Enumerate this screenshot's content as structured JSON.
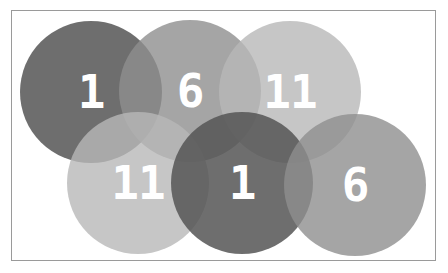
{
  "canvas": {
    "width": 448,
    "height": 273,
    "border_color": "#9a9a9a"
  },
  "circles": [
    {
      "label": "1",
      "cx": 91,
      "cy": 92,
      "r": 71,
      "color": "#555555",
      "opacity": 0.85
    },
    {
      "label": "6",
      "cx": 190,
      "cy": 91,
      "r": 71,
      "color": "#8e8e8e",
      "opacity": 0.8
    },
    {
      "label": "11",
      "cx": 290,
      "cy": 92,
      "r": 71,
      "color": "#b8b8b8",
      "opacity": 0.8
    },
    {
      "label": "11",
      "cx": 138,
      "cy": 183,
      "r": 71,
      "color": "#b8b8b8",
      "opacity": 0.8
    },
    {
      "label": "1",
      "cx": 242,
      "cy": 183,
      "r": 71,
      "color": "#555555",
      "opacity": 0.85
    },
    {
      "label": "6",
      "cx": 355,
      "cy": 185,
      "r": 71,
      "color": "#8e8e8e",
      "opacity": 0.8
    }
  ]
}
